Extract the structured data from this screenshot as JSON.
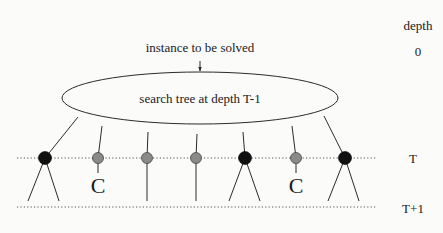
{
  "diagram": {
    "top_label": "instance to be solved",
    "ellipse_label": "search tree at depth T-1",
    "depth_header": "depth",
    "depth_levels": {
      "root": "0",
      "t": "T",
      "t_plus_1": "T+1"
    },
    "colors": {
      "black_node": "#111111",
      "gray_node": "#8a8a8a",
      "line": "#2a2a2a"
    },
    "nodes": [
      {
        "x": 45,
        "type": "black",
        "children": "subtree"
      },
      {
        "x": 98,
        "type": "gray",
        "children": "C"
      },
      {
        "x": 147,
        "type": "gray",
        "children": "line"
      },
      {
        "x": 196,
        "type": "gray",
        "children": "line"
      },
      {
        "x": 245,
        "type": "black",
        "children": "subtree"
      },
      {
        "x": 296,
        "type": "gray",
        "children": "C"
      },
      {
        "x": 345,
        "type": "black",
        "children": "subtree"
      }
    ],
    "completed_marker": "C"
  }
}
